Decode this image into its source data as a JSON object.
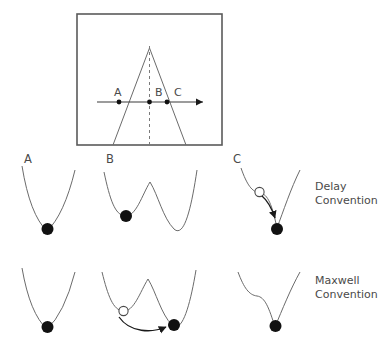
{
  "figure": {
    "colors": {
      "curve": "#6b6b6b",
      "frame": "#5a5a5a",
      "ball_filled": "#111111",
      "ball_hollow_stroke": "#4a4a4a",
      "text": "#4a4a4a",
      "axis": "#3a3a3a",
      "background": "#ffffff"
    }
  },
  "control_plane": {
    "name": "cusp-control-plane",
    "path_points": [
      {
        "label": "A",
        "x_fraction": 0.22,
        "state": "outside-cusp-left"
      },
      {
        "label": "B",
        "x_fraction": 0.59,
        "state": "inside-cusp"
      },
      {
        "label": "C",
        "x_fraction": 0.73,
        "state": "on-fold-right"
      }
    ],
    "axis_label": "",
    "has_arrow": true,
    "cusp_apex_label": ""
  },
  "rows": [
    {
      "name": "delay-convention-row",
      "convention_line1": "Delay",
      "convention_line2": "Convention",
      "panels": [
        {
          "label": "A",
          "well_type": "single-well",
          "ball_state": "filled",
          "ball_position": "bottom",
          "has_hollow_ball": false,
          "has_arrow": false
        },
        {
          "label": "B",
          "well_type": "double-well",
          "ball_state": "filled",
          "ball_position": "left-well",
          "has_hollow_ball": false,
          "has_arrow": false
        },
        {
          "label": "C",
          "well_type": "fold-shoulder-well",
          "ball_state": "filled",
          "ball_position": "bottom",
          "has_hollow_ball": true,
          "has_arrow": true
        }
      ]
    },
    {
      "name": "maxwell-convention-row",
      "convention_line1": "Maxwell",
      "convention_line2": "Convention",
      "panels": [
        {
          "label": "",
          "well_type": "single-well",
          "ball_state": "filled",
          "ball_position": "bottom",
          "has_hollow_ball": false,
          "has_arrow": false
        },
        {
          "label": "",
          "well_type": "double-well",
          "ball_state": "filled",
          "ball_position": "right-well",
          "has_hollow_ball": true,
          "has_arrow": true
        },
        {
          "label": "",
          "well_type": "shoulder-well",
          "ball_state": "filled",
          "ball_position": "bottom",
          "has_hollow_ball": false,
          "has_arrow": false
        }
      ]
    }
  ]
}
